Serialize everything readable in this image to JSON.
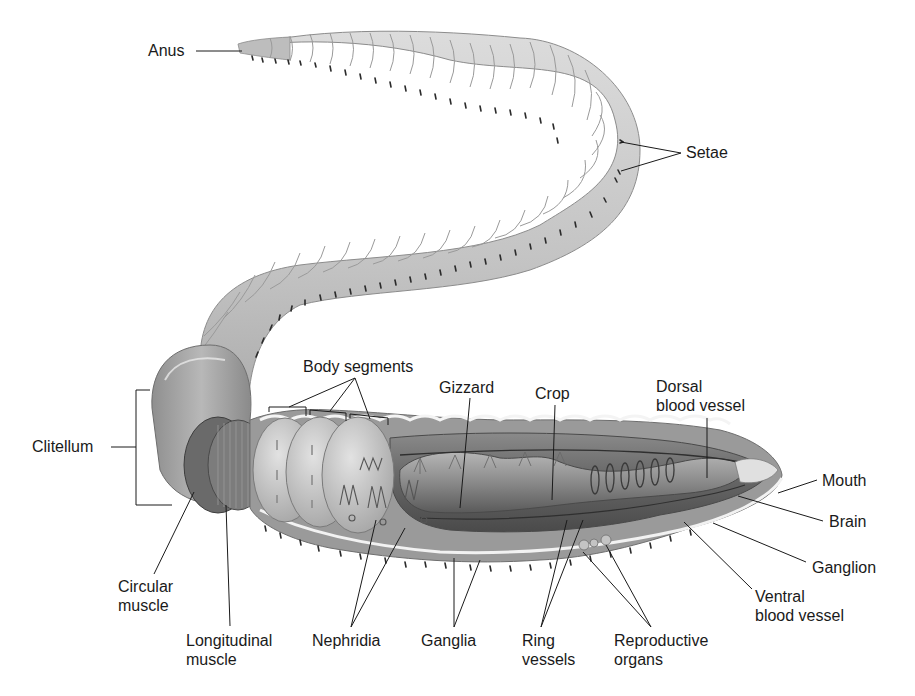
{
  "diagram": {
    "colors": {
      "background": "#ffffff",
      "body_light": "#cfcfcf",
      "body_mid": "#a9a9a9",
      "body_dark": "#6e6e6e",
      "interior_dark": "#555555",
      "section_face": "#e6e6e6",
      "setae": "#2a2a2a",
      "leader_line": "#1a1a1a",
      "label_text": "#1a1a1a"
    },
    "labels": {
      "anus": "Anus",
      "setae": "Setae",
      "body_segments": "Body segments",
      "gizzard": "Gizzard",
      "crop": "Crop",
      "dorsal_blood_vessel": "Dorsal\nblood vessel",
      "clitellum": "Clitellum",
      "mouth": "Mouth",
      "brain": "Brain",
      "ganglion": "Ganglion",
      "ventral_blood_vessel": "Ventral\nblood vessel",
      "circular_muscle": "Circular\nmuscle",
      "longitudinal_muscle": "Longitudinal\nmuscle",
      "nephridia": "Nephridia",
      "ganglia": "Ganglia",
      "ring_vessels": "Ring\nvessels",
      "reproductive_organs": "Reproductive\norgans"
    }
  }
}
